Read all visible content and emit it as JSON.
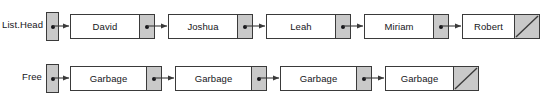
{
  "diagram": {
    "background_color": "#ffffff",
    "line_color": "#3a3a3a",
    "pointer_cell_color": "#c9c9c9",
    "data_cell_color": "#ffffff",
    "text_color": "#16161a"
  },
  "rows": [
    {
      "id": "list",
      "label": "List.Head",
      "head_pointer_icon": "pointer-dot-icon",
      "nodes": [
        {
          "value": "David",
          "pointer": "next"
        },
        {
          "value": "Joshua",
          "pointer": "next"
        },
        {
          "value": "Leah",
          "pointer": "next"
        },
        {
          "value": "Miriam",
          "pointer": "next"
        },
        {
          "value": "Robert",
          "pointer": "null"
        }
      ]
    },
    {
      "id": "free",
      "label": "Free",
      "head_pointer_icon": "pointer-dot-icon",
      "nodes": [
        {
          "value": "Garbage",
          "pointer": "next"
        },
        {
          "value": "Garbage",
          "pointer": "next"
        },
        {
          "value": "Garbage",
          "pointer": "next"
        },
        {
          "value": "Garbage",
          "pointer": "null"
        }
      ]
    }
  ]
}
